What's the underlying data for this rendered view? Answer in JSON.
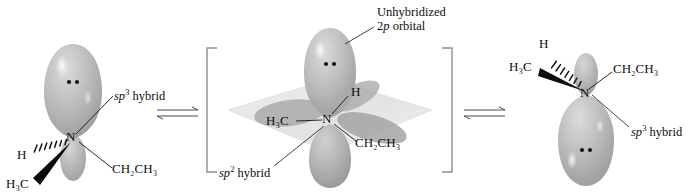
{
  "figure": {
    "type": "chemical-mechanism-diagram",
    "background": "#ffffff",
    "ink_color": "#0d0d0d",
    "orbital_fill": "#b9b9b9",
    "plane_fill": "#e2e2e2",
    "bracket_color": "#8a8a8a"
  },
  "structures": {
    "left": {
      "name": "sp3-pyramidal-amine-left",
      "center_atom": "N",
      "hybrid_label": "hybrid",
      "hybrid_orbital": "sp",
      "hybrid_superscript": "3",
      "substituents": [
        {
          "label_html": "H",
          "text": "H",
          "bond_style": "hashed-wedge"
        },
        {
          "label_html": "H3C",
          "text": "H₃C",
          "bond_style": "bold-wedge"
        },
        {
          "label_html": "CH2CH3",
          "text": "CH₂CH₃",
          "bond_style": "plain-line"
        }
      ],
      "lone_pair": "••",
      "lone_pair_location": "top-lobe"
    },
    "center": {
      "name": "sp2-planar-transition-state",
      "center_atom": "N",
      "in_brackets": true,
      "top_label_line1": "Unhybridized",
      "top_label_line2_orbital": "2",
      "top_label_line2_italic": "p",
      "top_label_line2_rest": " orbital",
      "hybrid_orbital": "sp",
      "hybrid_superscript": "2",
      "hybrid_label": "hybrid",
      "substituents": [
        {
          "label_html": "H",
          "text": "H",
          "bond_style": "plain-line"
        },
        {
          "label_html": "H3C",
          "text": "H₃C",
          "bond_style": "plain-line"
        },
        {
          "label_html": "CH2CH3",
          "text": "CH₂CH₃",
          "bond_style": "plain-line"
        }
      ],
      "lone_pair": "••",
      "lone_pair_location": "upper-p-lobe"
    },
    "right": {
      "name": "sp3-pyramidal-amine-right-inverted",
      "center_atom": "N",
      "hybrid_label": "hybrid",
      "hybrid_orbital": "sp",
      "hybrid_superscript": "3",
      "substituents": [
        {
          "label_html": "H",
          "text": "H",
          "bond_style": "hashed-wedge"
        },
        {
          "label_html": "H3C",
          "text": "H₃C",
          "bond_style": "bold-wedge"
        },
        {
          "label_html": "CH2CH3",
          "text": "CH₂CH₃",
          "bond_style": "plain-line"
        }
      ],
      "lone_pair": "••",
      "lone_pair_location": "bottom-lobe"
    }
  },
  "arrows": {
    "left_equilibrium": {
      "name": "equilibrium-arrow-left",
      "glyph": "⇌"
    },
    "right_equilibrium": {
      "name": "equilibrium-arrow-right",
      "glyph": "⇌"
    }
  }
}
